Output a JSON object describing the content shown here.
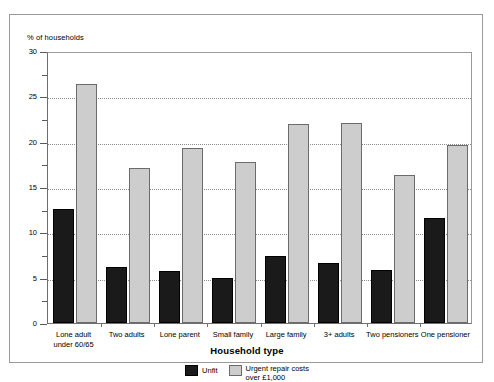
{
  "chart_data": {
    "type": "bar",
    "title": "",
    "xlabel": "Household type",
    "ylabel": "% of households",
    "ylim": [
      0,
      30
    ],
    "yticks": [
      0,
      5,
      10,
      15,
      20,
      25,
      30
    ],
    "ytick_labels": [
      "0",
      "5",
      "10",
      "15",
      "20",
      "25",
      "30"
    ],
    "minor_tick_step": 2.5,
    "grid": "horizontal-dotted-at-major-ticks",
    "legend_position": "bottom-center",
    "categories": [
      "Lone adult\nunder 60/65",
      "Two adults",
      "Lone parent",
      "Small family",
      "Large family",
      "3+ adults",
      "Two pensioners",
      "One pensioner"
    ],
    "series": [
      {
        "name": "Unfit",
        "color": "#1a1a1a",
        "values": [
          12.6,
          6.2,
          5.7,
          5.0,
          7.4,
          6.6,
          5.9,
          11.6
        ]
      },
      {
        "name": "Urgent repair costs\nover £1,000",
        "color": "#cdcdcd",
        "values": [
          26.4,
          17.1,
          19.3,
          17.8,
          21.9,
          22.1,
          16.3,
          19.6
        ]
      }
    ]
  },
  "legend": {
    "entries": [
      {
        "label": "Unfit"
      },
      {
        "label": "Urgent repair costs\nover £1,000"
      }
    ]
  }
}
